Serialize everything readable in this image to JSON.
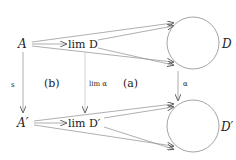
{
  "diagram": {
    "nodes": {
      "A": "A",
      "limD": "lim D",
      "D": "D",
      "Aprime": "A′",
      "limDprime": "lim D′",
      "Dprime": "D′"
    },
    "edge_labels": {
      "s": "s",
      "lim_alpha": "lim α",
      "alpha": "α"
    },
    "region_labels": {
      "b": "(b)",
      "a": "(a)"
    },
    "colors": {
      "line": "#9a9a9a",
      "arrowhead": "#555555",
      "text": "#222222"
    }
  }
}
